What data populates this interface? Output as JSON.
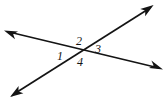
{
  "figure": {
    "type": "geometry-diagram",
    "background_color": "#ffffff",
    "stroke_color": "#141414",
    "label_color": "#141414",
    "canvas": {
      "width": 166,
      "height": 101
    },
    "intersection_point": {
      "x": 80,
      "y": 52
    },
    "lines": [
      {
        "name": "line-upper-left-to-lower-right",
        "start": {
          "x": 12,
          "y": 33
        },
        "end": {
          "x": 158,
          "y": 68
        },
        "arrow_start": "arrowhead-upper-left",
        "arrow_end": "arrowhead-lower-right"
      },
      {
        "name": "line-lower-left-to-upper-right",
        "start": {
          "x": 16,
          "y": 93
        },
        "end": {
          "x": 148,
          "y": 9
        },
        "arrow_start": "arrowhead-lower-left",
        "arrow_end": "arrowhead-upper-right"
      }
    ],
    "angle_labels": [
      {
        "id": "angle-1",
        "text": "1",
        "x": 60,
        "y": 57,
        "position": "left"
      },
      {
        "id": "angle-2",
        "text": "2",
        "x": 79,
        "y": 42,
        "position": "top"
      },
      {
        "id": "angle-3",
        "text": "3",
        "x": 98,
        "y": 50,
        "position": "right"
      },
      {
        "id": "angle-4",
        "text": "4",
        "x": 80,
        "y": 63,
        "position": "bottom"
      }
    ],
    "arrowheads": [
      {
        "id": "arrowhead-upper-left",
        "tip_x": 5,
        "tip_y": 31,
        "direction": "upper-left"
      },
      {
        "id": "arrowhead-lower-right",
        "tip_x": 162,
        "tip_y": 69,
        "direction": "lower-right"
      },
      {
        "id": "arrowhead-lower-left",
        "tip_x": 11,
        "tip_y": 96,
        "direction": "lower-left"
      },
      {
        "id": "arrowhead-upper-right",
        "tip_x": 152,
        "tip_y": 6,
        "direction": "upper-right"
      }
    ]
  }
}
